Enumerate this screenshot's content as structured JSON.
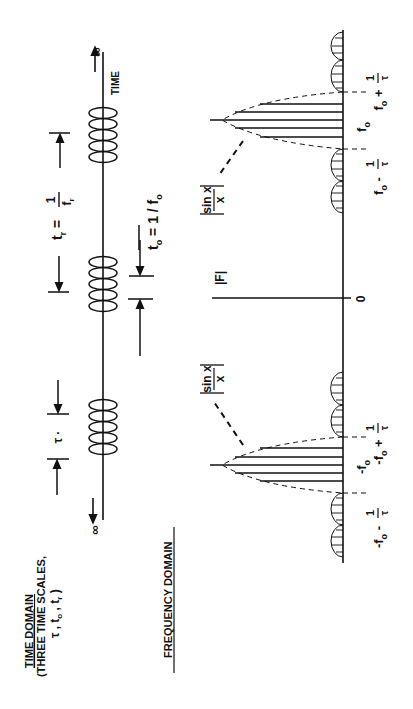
{
  "time_domain": {
    "title": "TIME DOMAIN",
    "subtitle": "(THREE TIME SCALES,",
    "scales": "τ , t",
    "scales_sub1": "o",
    "scales_mid": " , t",
    "scales_sub2": "r",
    "scales_end": " )",
    "axis_label": "TIME",
    "infinity_top": "∞",
    "infinity_bottom": "∞",
    "tau_label": "τ",
    "tr_label": "t",
    "tr_sub": "r",
    "tr_eq": " = ",
    "tr_num": "1",
    "tr_den": "f",
    "tr_den_sub": "r",
    "to_label": "t",
    "to_sub": "o",
    "to_eq": " = 1 / f",
    "to_eq_sub": "o"
  },
  "frequency_domain": {
    "title": "FREQUENCY DOMAIN",
    "magnitude_label": "|F|",
    "zero_label": "0",
    "envelope_label_num": "sin x",
    "envelope_label_den": "x",
    "pos_center": "f",
    "pos_center_sub": "o",
    "pos_minus": "f",
    "pos_minus_sub": "o",
    "pos_minus_op": " - ",
    "pos_plus": "f",
    "pos_plus_sub": "o",
    "pos_plus_op": " + ",
    "neg_center": "-f",
    "neg_center_sub": "o",
    "neg_minus": "-f",
    "neg_minus_sub": "o",
    "neg_minus_op": " - ",
    "neg_plus": "-f",
    "neg_plus_sub": "o",
    "neg_plus_op": " + ",
    "frac_num": "1",
    "frac_den": "τ"
  }
}
